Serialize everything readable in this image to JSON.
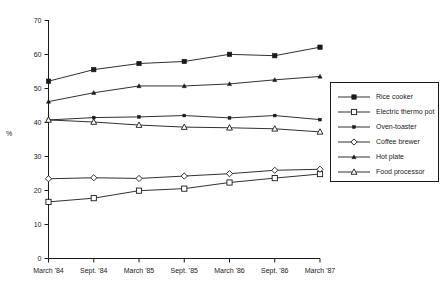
{
  "chart_data": {
    "type": "line",
    "title": "",
    "xlabel": "",
    "ylabel": "%",
    "ylim": [
      0,
      70
    ],
    "ytick_step": 10,
    "yticks": [
      0,
      10,
      20,
      30,
      40,
      50,
      60,
      70
    ],
    "grid": false,
    "legend_position": "right",
    "categories": [
      "March '84",
      "Sept. '84",
      "March '85",
      "Sept. '85",
      "March '86",
      "Sept. '86",
      "March '87"
    ],
    "series": [
      {
        "name": "Rice cooker",
        "marker": "filled-square",
        "values": [
          52.0,
          55.4,
          57.2,
          57.8,
          59.9,
          59.5,
          62.0
        ]
      },
      {
        "name": "Electric thermo pot",
        "marker": "open-square",
        "values": [
          16.5,
          17.6,
          19.8,
          20.4,
          22.2,
          23.5,
          24.7
        ]
      },
      {
        "name": "Oven-toaster",
        "marker": "small-filled-dot",
        "values": [
          40.6,
          41.3,
          41.5,
          41.9,
          41.2,
          41.9,
          40.7
        ]
      },
      {
        "name": "Coffee brewer",
        "marker": "open-diamond",
        "values": [
          23.3,
          23.6,
          23.4,
          24.1,
          24.8,
          25.8,
          26.1
        ]
      },
      {
        "name": "Hot plate",
        "marker": "small-filled-triangle",
        "values": [
          46.0,
          48.6,
          50.6,
          50.6,
          51.2,
          52.4,
          53.4
        ]
      },
      {
        "name": "Food processor",
        "marker": "open-triangle",
        "values": [
          40.6,
          40.0,
          39.1,
          38.5,
          38.3,
          38.0,
          37.1
        ]
      }
    ]
  },
  "legend": {
    "entries": [
      {
        "label": "Rice cooker",
        "marker": "filled-square"
      },
      {
        "label": "Electric thermo pot",
        "marker": "open-square"
      },
      {
        "label": "Oven-toaster",
        "marker": "small-filled-dot"
      },
      {
        "label": "Coffee brewer",
        "marker": "open-diamond"
      },
      {
        "label": "Hot plate",
        "marker": "small-filled-triangle"
      },
      {
        "label": "Food processor",
        "marker": "open-triangle"
      }
    ]
  },
  "colors": {
    "ink": "#1a1a1a",
    "background": "#ffffff"
  }
}
